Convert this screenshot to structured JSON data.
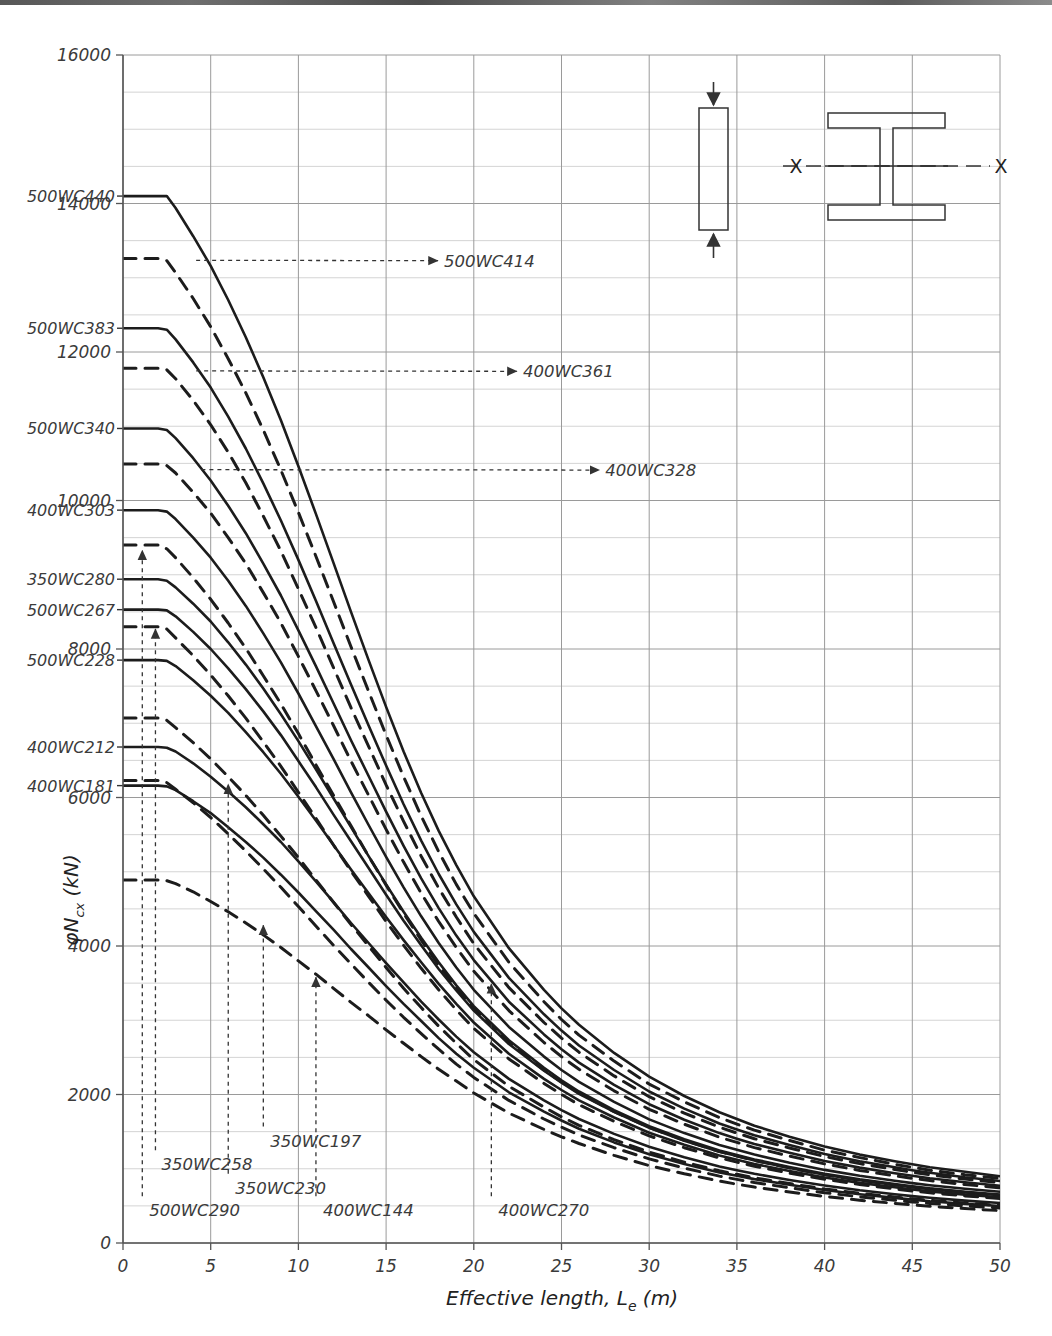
{
  "chart_data": {
    "type": "line",
    "title": "",
    "xlabel": "Effective length, Le (m)",
    "xlabel_parts": {
      "main": "Effective length, L",
      "sub": "e",
      "unit": " (m)"
    },
    "ylabel": "φNcx (kN)",
    "ylabel_parts": {
      "phi": "φ",
      "n": "N",
      "sub": "cx",
      "unit": " (kN)"
    },
    "xlim": [
      0,
      50
    ],
    "ylim": [
      0,
      16000
    ],
    "xticks": [
      0,
      5,
      10,
      15,
      20,
      25,
      30,
      35,
      40,
      45,
      50
    ],
    "yticks": [
      0,
      2000,
      4000,
      6000,
      8000,
      10000,
      12000,
      14000,
      16000
    ],
    "ytick_labels": [
      "0",
      "2000",
      "4000",
      "6000",
      "8000",
      "10000",
      "12000",
      "14000",
      "16000"
    ],
    "xtick_labels": [
      "0",
      "5",
      "10",
      "15",
      "20",
      "25",
      "30",
      "35",
      "40",
      "45",
      "50"
    ],
    "minor_y_step": 500,
    "grid": true,
    "legend": "none",
    "x_values": [
      0,
      1,
      2,
      2.5,
      3,
      4,
      5,
      6,
      7,
      8,
      9,
      10,
      11,
      12,
      13,
      14,
      15,
      16,
      17,
      18,
      19,
      20,
      22,
      24,
      25,
      26,
      28,
      30,
      32,
      34,
      35,
      36,
      38,
      40,
      42,
      44,
      45,
      46,
      48,
      50
    ],
    "series": [
      {
        "name": "500WC440",
        "style": "solid",
        "label_side": "left",
        "values": [
          14100,
          14100,
          14100,
          14100,
          13940,
          13560,
          13160,
          12700,
          12200,
          11660,
          11080,
          10460,
          9820,
          9160,
          8500,
          7850,
          7220,
          6620,
          6060,
          5550,
          5090,
          4670,
          3970,
          3410,
          3160,
          2940,
          2560,
          2240,
          1980,
          1760,
          1670,
          1580,
          1430,
          1300,
          1190,
          1100,
          1060,
          1020,
          960,
          900
        ]
      },
      {
        "name": "500WC414",
        "style": "dashed",
        "label_side": "callout",
        "values": [
          13260,
          13260,
          13260,
          13230,
          13070,
          12720,
          12340,
          11910,
          11450,
          10950,
          10410,
          9840,
          9250,
          8640,
          8030,
          7430,
          6840,
          6280,
          5750,
          5270,
          4830,
          4440,
          3780,
          3250,
          3010,
          2800,
          2450,
          2140,
          1900,
          1690,
          1600,
          1520,
          1380,
          1250,
          1150,
          1060,
          1020,
          980,
          920,
          870
        ]
      },
      {
        "name": "500WC383",
        "style": "solid",
        "label_side": "left",
        "values": [
          12320,
          12320,
          12320,
          12300,
          12170,
          11860,
          11520,
          11130,
          10700,
          10230,
          9730,
          9200,
          8650,
          8080,
          7520,
          6970,
          6430,
          5910,
          5420,
          4970,
          4560,
          4190,
          3570,
          3080,
          2860,
          2660,
          2330,
          2040,
          1810,
          1610,
          1530,
          1450,
          1320,
          1200,
          1100,
          1020,
          980,
          945,
          885,
          835
        ]
      },
      {
        "name": "400WC361",
        "style": "dashed",
        "label_side": "callout",
        "values": [
          11780,
          11780,
          11780,
          11760,
          11640,
          11350,
          11020,
          10650,
          10240,
          9790,
          9320,
          8810,
          8290,
          7750,
          7210,
          6690,
          6170,
          5680,
          5210,
          4780,
          4390,
          4030,
          3440,
          2970,
          2760,
          2570,
          2250,
          1970,
          1750,
          1560,
          1480,
          1405,
          1280,
          1165,
          1070,
          990,
          952,
          918,
          860,
          812
        ]
      },
      {
        "name": "500WC340",
        "style": "solid",
        "label_side": "left",
        "values": [
          10970,
          10970,
          10970,
          10950,
          10840,
          10570,
          10270,
          9930,
          9560,
          9150,
          8720,
          8250,
          7770,
          7270,
          6770,
          6290,
          5810,
          5350,
          4910,
          4510,
          4140,
          3810,
          3250,
          2810,
          2610,
          2430,
          2130,
          1870,
          1660,
          1480,
          1405,
          1335,
          1215,
          1105,
          1015,
          940,
          905,
          872,
          818,
          772
        ]
      },
      {
        "name": "400WC328",
        "style": "dashed",
        "label_side": "callout",
        "values": [
          10490,
          10490,
          10490,
          10470,
          10370,
          10110,
          9830,
          9500,
          9150,
          8760,
          8350,
          7900,
          7440,
          6970,
          6490,
          6030,
          5570,
          5130,
          4710,
          4330,
          3980,
          3660,
          3130,
          2700,
          2510,
          2340,
          2050,
          1800,
          1600,
          1425,
          1355,
          1285,
          1170,
          1065,
          978,
          905,
          872,
          840,
          788,
          744
        ]
      },
      {
        "name": "400WC303",
        "style": "solid",
        "label_side": "left",
        "values": [
          9870,
          9870,
          9870,
          9850,
          9750,
          9500,
          9230,
          8920,
          8580,
          8210,
          7820,
          7400,
          6960,
          6520,
          6070,
          5630,
          5200,
          4790,
          4400,
          4040,
          3710,
          3410,
          2910,
          2510,
          2330,
          2170,
          1900,
          1665,
          1480,
          1320,
          1255,
          1190,
          1082,
          985,
          905,
          838,
          807,
          778,
          730,
          690
        ]
      },
      {
        "name": "350WC280",
        "style": "dashed",
        "label_side": "left",
        "values": [
          9400,
          9400,
          9400,
          9350,
          9230,
          8960,
          8670,
          8350,
          8010,
          7640,
          7260,
          6860,
          6440,
          6030,
          5620,
          5210,
          4820,
          4440,
          4080,
          3740,
          3440,
          3160,
          2700,
          2330,
          2170,
          2020,
          1770,
          1555,
          1382,
          1232,
          1172,
          1112,
          1012,
          920,
          845,
          782,
          753,
          726,
          681,
          643
        ]
      },
      {
        "name": "350WC280b",
        "style": "solid",
        "label_side": "left",
        "values": [
          8940,
          8940,
          8940,
          8920,
          8830,
          8610,
          8370,
          8090,
          7790,
          7470,
          7120,
          6760,
          6380,
          5990,
          5600,
          5210,
          4830,
          4460,
          4110,
          3780,
          3470,
          3190,
          2730,
          2360,
          2190,
          2040,
          1790,
          1572,
          1398,
          1247,
          1186,
          1126,
          1025,
          933,
          857,
          793,
          763,
          736,
          690,
          652
        ]
      },
      {
        "name": "500WC267",
        "style": "solid",
        "label_side": "left",
        "values": [
          8530,
          8530,
          8530,
          8520,
          8440,
          8230,
          8000,
          7740,
          7460,
          7160,
          6840,
          6490,
          6140,
          5770,
          5410,
          5050,
          4690,
          4340,
          4010,
          3690,
          3400,
          3130,
          2680,
          2320,
          2160,
          2010,
          1765,
          1550,
          1378,
          1230,
          1170,
          1110,
          1010,
          920,
          845,
          782,
          752,
          725,
          680,
          642
        ]
      },
      {
        "name": "500WC267b",
        "style": "dashed",
        "label_side": "left",
        "values": [
          8300,
          8300,
          8300,
          8270,
          8150,
          7910,
          7650,
          7370,
          7070,
          6750,
          6420,
          6070,
          5720,
          5360,
          5010,
          4670,
          4330,
          4010,
          3700,
          3410,
          3140,
          2890,
          2480,
          2150,
          2000,
          1863,
          1638,
          1442,
          1283,
          1146,
          1090,
          1035,
          942,
          858,
          788,
          729,
          701,
          676,
          634,
          599
        ]
      },
      {
        "name": "500WC228",
        "style": "solid",
        "label_side": "left",
        "values": [
          7850,
          7850,
          7850,
          7840,
          7770,
          7580,
          7370,
          7140,
          6880,
          6610,
          6320,
          6010,
          5690,
          5360,
          5030,
          4710,
          4390,
          4080,
          3780,
          3490,
          3220,
          2970,
          2550,
          2210,
          2060,
          1920,
          1690,
          1486,
          1322,
          1180,
          1122,
          1064,
          969,
          882,
          810,
          750,
          721,
          695,
          652,
          616
        ]
      },
      {
        "name": "500WC228b",
        "style": "dashed",
        "label_side": "left",
        "values": [
          7070,
          7070,
          7070,
          7040,
          6940,
          6740,
          6520,
          6280,
          6030,
          5760,
          5480,
          5190,
          4890,
          4590,
          4290,
          4000,
          3710,
          3430,
          3170,
          2920,
          2690,
          2470,
          2110,
          1830,
          1700,
          1585,
          1392,
          1224,
          1090,
          972,
          925,
          878,
          800,
          728,
          669,
          619,
          595,
          574,
          538,
          508
        ]
      },
      {
        "name": "400WC212",
        "style": "solid",
        "label_side": "left",
        "values": [
          6680,
          6680,
          6680,
          6670,
          6620,
          6460,
          6280,
          6080,
          5870,
          5640,
          5400,
          5140,
          4870,
          4590,
          4310,
          4040,
          3770,
          3510,
          3250,
          3010,
          2780,
          2570,
          2210,
          1920,
          1790,
          1670,
          1470,
          1295,
          1154,
          1030,
          980,
          932,
          849,
          774,
          710,
          657,
          632,
          609,
          571,
          539
        ]
      },
      {
        "name": "400WC181",
        "style": "solid",
        "label_side": "left",
        "values": [
          6160,
          6160,
          6160,
          6150,
          6100,
          5950,
          5790,
          5600,
          5400,
          5190,
          4960,
          4720,
          4470,
          4220,
          3960,
          3710,
          3460,
          3220,
          2990,
          2760,
          2550,
          2360,
          2030,
          1770,
          1650,
          1540,
          1355,
          1195,
          1065,
          951,
          905,
          860,
          784,
          714,
          656,
          607,
          584,
          562,
          527,
          498
        ]
      },
      {
        "name": "400WC181b",
        "style": "dashed",
        "label_side": "left",
        "values": [
          6230,
          6230,
          6230,
          6200,
          6110,
          5930,
          5730,
          5510,
          5280,
          5040,
          4790,
          4530,
          4270,
          4010,
          3760,
          3510,
          3270,
          3040,
          2820,
          2610,
          2410,
          2230,
          1920,
          1670,
          1560,
          1455,
          1283,
          1132,
          1009,
          901,
          857,
          815,
          743,
          677,
          622,
          576,
          554,
          533,
          500,
          472
        ]
      },
      {
        "name": "350WC197",
        "style": "dashed",
        "label_side": "bottom",
        "values": [
          4890,
          4890,
          4890,
          4880,
          4840,
          4730,
          4600,
          4460,
          4310,
          4150,
          3980,
          3800,
          3620,
          3430,
          3240,
          3060,
          2870,
          2690,
          2510,
          2340,
          2180,
          2020,
          1750,
          1530,
          1430,
          1340,
          1180,
          1043,
          932,
          833,
          792,
          753,
          687,
          627,
          576,
          533,
          513,
          494,
          463,
          437
        ]
      }
    ]
  },
  "y_left_labels": [
    {
      "text": "500WC440",
      "value": 14100
    },
    {
      "text": "500WC383",
      "value": 12320
    },
    {
      "text": "500WC340",
      "value": 10970
    },
    {
      "text": "400WC303",
      "value": 9870
    },
    {
      "text": "350WC280",
      "value": 8940
    },
    {
      "text": "500WC267",
      "value": 8530
    },
    {
      "text": "500WC228",
      "value": 7850
    },
    {
      "text": "400WC212",
      "value": 6680
    },
    {
      "text": "400WC181",
      "value": 6160
    }
  ],
  "callouts": [
    {
      "text": "500WC414",
      "label_x": 18.3,
      "label_y": 13230,
      "tip_x": 3.6,
      "tip_y": 13235
    },
    {
      "text": "400WC361",
      "label_x": 22.8,
      "label_y": 11740,
      "tip_x": 3.6,
      "tip_y": 11745
    },
    {
      "text": "400WC328",
      "label_x": 27.5,
      "label_y": 10410,
      "tip_x": 3.9,
      "tip_y": 10415
    }
  ],
  "bottom_callouts": [
    {
      "text": "500WC290",
      "tick_x": 1.1,
      "label_x": 1.5,
      "label_y": 440,
      "tip_y": 9330
    },
    {
      "text": "350WC258",
      "tick_x": 1.85,
      "label_x": 2.2,
      "label_y": 1060,
      "tip_y": 8270
    },
    {
      "text": "350WC230",
      "tick_x": 6.0,
      "label_x": 6.4,
      "label_y": 745,
      "tip_y": 6180
    },
    {
      "text": "350WC197",
      "tick_x": 8.0,
      "label_x": 8.4,
      "label_y": 1380,
      "tip_y": 4280
    },
    {
      "text": "400WC144",
      "tick_x": 11.0,
      "label_x": 11.4,
      "label_y": 440,
      "tip_y": 3580
    },
    {
      "text": "400WC270",
      "tick_x": 21.0,
      "label_x": 21.4,
      "label_y": 440,
      "tip_y": 3490
    }
  ],
  "diagram": {
    "column_label": "",
    "axis_label_left": "X",
    "axis_label_right": "X",
    "icon_column": "column-with-axial-load-icon",
    "icon_section": "i-beam-section-icon",
    "icon_arrow_top": "down-arrow-icon",
    "icon_arrow_bottom": "up-arrow-icon"
  },
  "colors": {
    "curve": "#1c1c1c",
    "grid_major": "#9a9a9a",
    "grid_minor": "#cfcfcf",
    "axis": "#555555",
    "text": "#333333"
  }
}
